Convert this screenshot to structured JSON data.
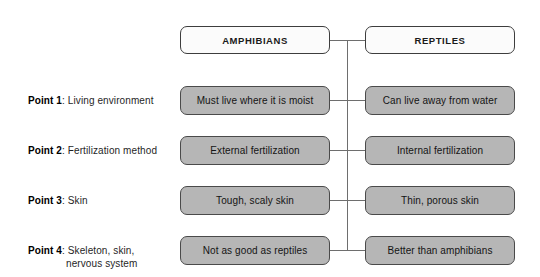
{
  "diagram": {
    "type": "comparison-chart",
    "columns": [
      {
        "id": "amphibians",
        "header": "AMPHIBIANS"
      },
      {
        "id": "reptiles",
        "header": "REPTILES"
      }
    ],
    "rows": [
      {
        "label_prefix": "Point 1",
        "label_sep": ": ",
        "label_text": "Living environment",
        "label_text_line2": "",
        "amphibians": "Must live where it is moist",
        "reptiles": "Can live away from water"
      },
      {
        "label_prefix": "Point 2",
        "label_sep": ": ",
        "label_text": "Fertilization method",
        "label_text_line2": "",
        "amphibians": "External fertilization",
        "reptiles": "Internal fertilization"
      },
      {
        "label_prefix": "Point 3",
        "label_sep": ": ",
        "label_text": "Skin",
        "label_text_line2": "",
        "amphibians": "Tough, scaly skin",
        "reptiles": "Thin, porous skin"
      },
      {
        "label_prefix": "Point 4",
        "label_sep": ": ",
        "label_text": "Skeleton, skin,",
        "label_text_line2": "nervous system",
        "amphibians": "Not as good as reptiles",
        "reptiles": "Better than amphibians"
      }
    ],
    "colors": {
      "header_fill": "#fbfbfb",
      "header_border": "#3d3d3d",
      "cell_fill": "#b6b6b6",
      "cell_border": "#4a4a4a",
      "connector": "#6e6e6e",
      "background": "#ffffff",
      "text": "#141414"
    }
  }
}
